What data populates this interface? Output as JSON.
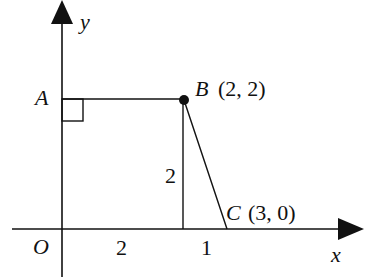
{
  "diagram": {
    "axes": {
      "x_label": "x",
      "y_label": "y",
      "origin_label": "O"
    },
    "points": {
      "A": {
        "label": "A"
      },
      "B": {
        "label": "B",
        "coords": "(2, 2)"
      },
      "C": {
        "label": "C",
        "coords": "(3, 0)"
      }
    },
    "measurements": {
      "segment_OD": "2",
      "segment_DC": "1",
      "height_BD": "2"
    },
    "colors": {
      "stroke": "#111111",
      "background": "#ffffff"
    }
  }
}
